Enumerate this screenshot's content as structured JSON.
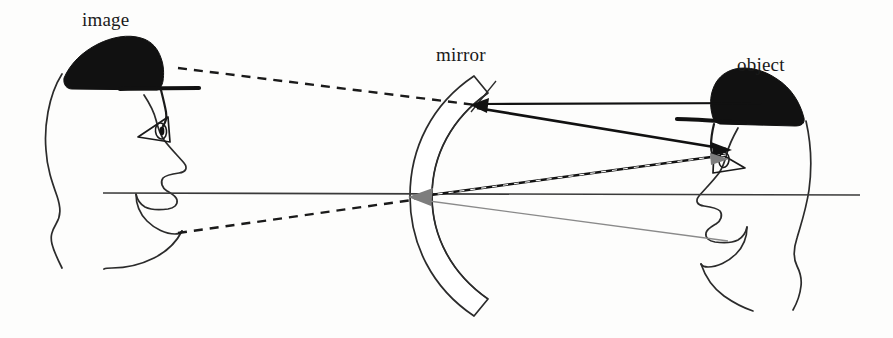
{
  "figure": {
    "background_color": "#fdfdfc",
    "labels": {
      "image": "image",
      "mirror": "mirror",
      "object": "object"
    },
    "colors": {
      "ink": "#1a1a1a",
      "outline": "#2b2b2b",
      "hat_fill": "#111111",
      "gray_ray": "#8a8a8a",
      "gray_arrow": "#7d7d7d",
      "axis": "#3a3a3a"
    },
    "optical_axis": {
      "name": "principal-axis",
      "x1": 103,
      "y1": 193,
      "x2": 860,
      "y2": 195,
      "style": "solid",
      "width": 1.6
    },
    "mirror": {
      "name": "concave-mirror",
      "vertex_x": 412,
      "vertex_y": 196,
      "top_y": 76,
      "bottom_y": 312,
      "thickness": 22,
      "opens": "right"
    },
    "rays": [
      {
        "name": "virtual-ray-upper",
        "style": "dashed",
        "color": "#1a1a1a",
        "width": 2.4,
        "dash": "9 7",
        "points": "178,68 476,105",
        "arrow": "none"
      },
      {
        "name": "virtual-ray-lower",
        "style": "dashed",
        "color": "#1a1a1a",
        "width": 2.4,
        "dash": "9 7",
        "points": "178,233 412,200",
        "arrow": "none"
      },
      {
        "name": "incident-ray-parallel",
        "style": "solid",
        "color": "#111111",
        "width": 2.2,
        "points": "760,104 480,104",
        "arrow": "left-at-mirror"
      },
      {
        "name": "reflected-ray-to-eye",
        "style": "solid",
        "color": "#111111",
        "width": 2.6,
        "points": "478,108 728,149",
        "arrow": "right-at-eye"
      },
      {
        "name": "incident-ray-to-vertex",
        "style": "dashed",
        "color": "#1a1a1a",
        "width": 2.6,
        "dash": "8 5",
        "points": "724,155 414,197",
        "arrow": "left-at-vertex"
      },
      {
        "name": "reflected-ray-from-vertex",
        "style": "solid",
        "color": "#8a8a8a",
        "width": 1.3,
        "points": "414,199 728,241",
        "arrow": "none"
      },
      {
        "name": "mirror-normal-line",
        "style": "solid",
        "color": "#2b2b2b",
        "width": 1.3,
        "points": "495,82 472,112",
        "arrow": "none"
      }
    ],
    "arrowheads": [
      {
        "name": "arrowhead-at-mirror-top",
        "x": 478,
        "y": 105,
        "direction": "left",
        "color": "#111111",
        "size": 13
      },
      {
        "name": "arrowhead-at-object-eye",
        "x": 729,
        "y": 149,
        "direction": "right",
        "color": "#111111",
        "size": 13
      },
      {
        "name": "arrowhead-gray-at-object-eye",
        "x": 724,
        "y": 158,
        "direction": "right",
        "color": "#7d7d7d",
        "size": 11
      },
      {
        "name": "arrowhead-gray-at-vertex",
        "x": 412,
        "y": 197,
        "direction": "left",
        "color": "#7d7d7d",
        "size": 14
      }
    ],
    "heads": [
      {
        "name": "image-head",
        "facing": "right",
        "hat": true,
        "glasses": true,
        "label_ref": "image"
      },
      {
        "name": "object-head",
        "facing": "left",
        "hat": true,
        "glasses": true,
        "label_ref": "object"
      }
    ]
  }
}
